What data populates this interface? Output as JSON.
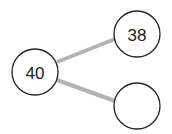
{
  "diagram": {
    "type": "tree",
    "edge_color": "#b3b3b3",
    "nodes": [
      {
        "id": "root",
        "label": "40",
        "cx": 35,
        "cy": 72,
        "r": 23
      },
      {
        "id": "child-upper",
        "label": "38",
        "cx": 137,
        "cy": 34,
        "r": 23
      },
      {
        "id": "child-lower",
        "label": "",
        "cx": 137,
        "cy": 106,
        "r": 23
      }
    ],
    "edges": [
      {
        "from": "root",
        "to": "child-upper"
      },
      {
        "from": "root",
        "to": "child-lower"
      }
    ]
  }
}
